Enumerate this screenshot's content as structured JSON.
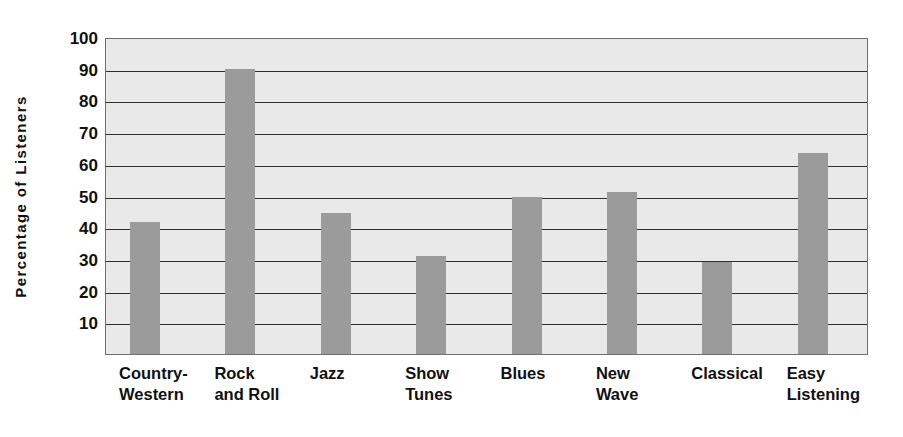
{
  "chart_data": {
    "type": "bar",
    "title": "",
    "subtitle": "",
    "xlabel": "",
    "ylabel": "Percentage of Listeners",
    "categories": [
      "Country-\nWestern",
      "Rock\nand Roll",
      "Jazz",
      "Show\nTunes",
      "Blues",
      "New\nWave",
      "Classical",
      "Easy\nListening"
    ],
    "values": [
      41.5,
      90,
      44.5,
      31,
      49.5,
      51,
      29,
      63.5
    ],
    "ylim": [
      0,
      100
    ],
    "ytick_labels": [
      "100",
      "90",
      "80",
      "70",
      "60",
      "50",
      "40",
      "30",
      "20",
      "10"
    ],
    "ytick_values": [
      100,
      90,
      80,
      70,
      60,
      50,
      40,
      30,
      20,
      10
    ],
    "grid": true,
    "legend": false,
    "legend_position": "none",
    "colors": {
      "bar_fill": "#9b9b9b",
      "plot_background": "#e9e9e9",
      "gridline": "#2f2f2f",
      "axis_border": "#6f6f6f",
      "text": "#111111"
    }
  }
}
